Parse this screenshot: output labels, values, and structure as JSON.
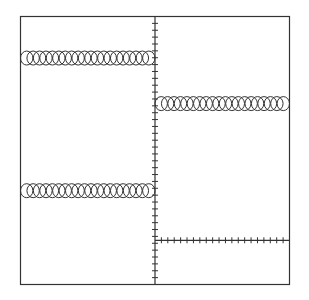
{
  "diagram": {
    "stroke_color": "#333333",
    "background_color": "#ffffff",
    "elements": [
      {
        "name": "circle-chain-top-left",
        "kind": "circles",
        "side": "left",
        "row_fraction": 0.155,
        "count": 20
      },
      {
        "name": "circle-chain-top-right",
        "kind": "circles",
        "side": "right",
        "row_fraction": 0.325,
        "count": 20
      },
      {
        "name": "circle-chain-bottom-left",
        "kind": "circles",
        "side": "left",
        "row_fraction": 0.65,
        "count": 20
      },
      {
        "name": "tick-line-bottom-right",
        "kind": "ticks",
        "side": "right",
        "row_fraction": 0.835,
        "count": 20
      }
    ],
    "center_axis_ticks": 38
  }
}
